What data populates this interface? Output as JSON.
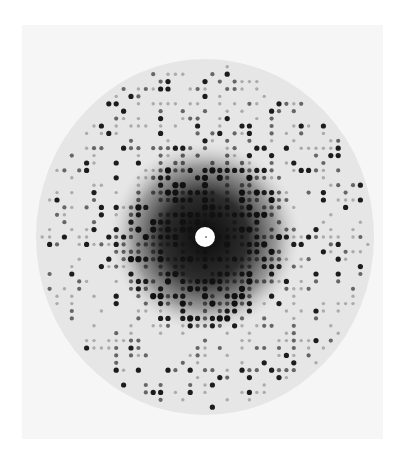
{
  "image": {
    "subject": "X-ray diffraction pattern",
    "background_color": "#ffffff",
    "plate_color": "#f6f6f6",
    "disc_color": "#e6e6e6"
  },
  "pattern": {
    "center": [
      205,
      237
    ],
    "radius_x": 169,
    "radius_y": 178,
    "beam_stop_radius": 10,
    "lattice_pitch": 7.4,
    "spot_color": "#111111",
    "halo_color": "#1a1a1a"
  }
}
